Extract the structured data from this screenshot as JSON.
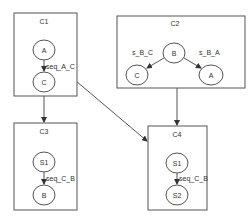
{
  "diagram": {
    "clusters": [
      {
        "id": "C1",
        "title": "C1",
        "nodes": [
          "A",
          "C"
        ],
        "edges": [
          {
            "from": "A",
            "to": "C",
            "label": "seq_A_C"
          }
        ]
      },
      {
        "id": "C2",
        "title": "C2",
        "nodes": [
          "B",
          "C",
          "A"
        ],
        "edges": [
          {
            "from": "B",
            "to": "C",
            "label": "s_B_C"
          },
          {
            "from": "B",
            "to": "A",
            "label": "s_B_A"
          }
        ]
      },
      {
        "id": "C3",
        "title": "C3",
        "nodes": [
          "S1",
          "B"
        ],
        "edges": [
          {
            "from": "S1",
            "to": "B",
            "label": "seq_C_B"
          }
        ]
      },
      {
        "id": "C4",
        "title": "C4",
        "nodes": [
          "S1",
          "S2"
        ],
        "edges": [
          {
            "from": "S1",
            "to": "S2",
            "label": "seq_C_B"
          }
        ]
      }
    ],
    "links": [
      {
        "from": "C1",
        "to": "C3"
      },
      {
        "from": "C1",
        "to": "C4"
      },
      {
        "from": "C2",
        "to": "C4"
      }
    ]
  },
  "c1": {
    "title": "C1",
    "n1": "A",
    "n2": "C",
    "edge": "seq_A_C"
  },
  "c2": {
    "title": "C2",
    "n1": "B",
    "n2": "C",
    "n3": "A",
    "edge1": "s_B_C",
    "edge2": "s_B_A"
  },
  "c3": {
    "title": "C3",
    "n1": "S1",
    "n2": "B",
    "edge": "seq_C_B"
  },
  "c4": {
    "title": "C4",
    "n1": "S1",
    "n2": "S2",
    "edge": "seq_C_B"
  }
}
